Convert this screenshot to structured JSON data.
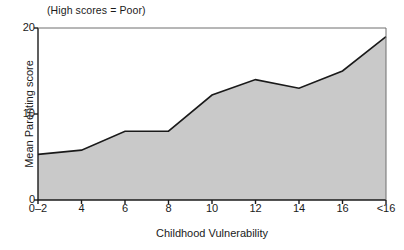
{
  "chart_data": {
    "type": "area",
    "title": "",
    "annotation": "(High scores = Poor)",
    "xlabel": "Childhood Vulnerability",
    "ylabel": "Mean Parenting score",
    "categories": [
      "0–2",
      "4",
      "6",
      "8",
      "10",
      "12",
      "14",
      "16",
      "<16"
    ],
    "values": [
      5.3,
      5.8,
      8.0,
      8.0,
      12.2,
      14.0,
      13.0,
      15.0,
      19.0
    ],
    "ylim": [
      0,
      20
    ],
    "yticks": [
      "0",
      "10",
      "20"
    ],
    "ytick_values": [
      0,
      10,
      20
    ],
    "grid": false,
    "legend": null,
    "series": [
      {
        "name": "Mean Parenting score",
        "values": [
          5.3,
          5.8,
          8.0,
          8.0,
          12.2,
          14.0,
          13.0,
          15.0,
          19.0
        ]
      }
    ],
    "colors": {
      "area_fill": "#c9c9c9",
      "line": "#1a1a1a",
      "axis": "#1a1a1a",
      "background": "#ffffff"
    }
  }
}
